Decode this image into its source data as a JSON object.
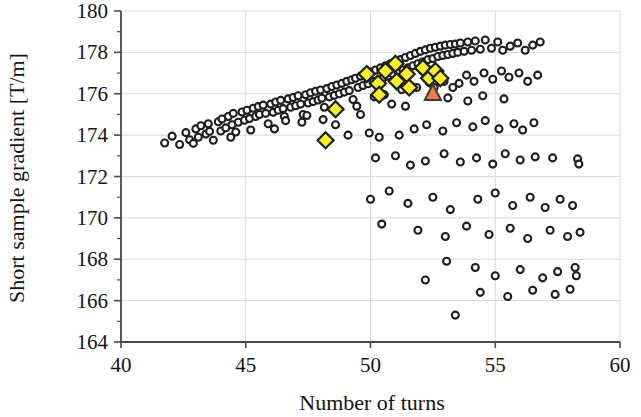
{
  "chart_data": {
    "type": "scatter",
    "title": "",
    "xlabel": "Number of turns",
    "ylabel": "Short sample gradient [T/m]",
    "xlim": [
      40,
      60
    ],
    "ylim": [
      164,
      180
    ],
    "xticks": [
      40,
      45,
      50,
      55,
      60
    ],
    "yticks": [
      164,
      166,
      168,
      170,
      172,
      174,
      176,
      178,
      180
    ],
    "grid": true,
    "grid_color": "#d8d8d8",
    "axis_color": "#4a4a4a",
    "legend": null,
    "series": [
      {
        "name": "design-population",
        "marker": "circle",
        "fill": "#ffffff",
        "edge": "#1e1e1e",
        "size": 7,
        "points": [
          [
            41.75,
            173.62
          ],
          [
            42.05,
            173.95
          ],
          [
            42.35,
            173.55
          ],
          [
            42.6,
            174.12
          ],
          [
            42.75,
            173.78
          ],
          [
            43.0,
            174.3
          ],
          [
            43.1,
            173.9
          ],
          [
            43.2,
            174.45
          ],
          [
            43.4,
            174.05
          ],
          [
            43.5,
            174.55
          ],
          [
            43.55,
            174.18
          ],
          [
            43.7,
            173.75
          ],
          [
            43.9,
            174.65
          ],
          [
            44.0,
            174.2
          ],
          [
            44.05,
            174.78
          ],
          [
            44.2,
            174.35
          ],
          [
            44.3,
            174.9
          ],
          [
            44.45,
            174.5
          ],
          [
            44.5,
            175.05
          ],
          [
            44.6,
            174.15
          ],
          [
            44.7,
            174.62
          ],
          [
            44.85,
            175.12
          ],
          [
            44.95,
            174.72
          ],
          [
            45.05,
            175.2
          ],
          [
            45.15,
            174.8
          ],
          [
            45.3,
            175.3
          ],
          [
            45.4,
            174.9
          ],
          [
            45.5,
            175.38
          ],
          [
            45.55,
            175.0
          ],
          [
            45.7,
            175.45
          ],
          [
            45.8,
            175.05
          ],
          [
            45.9,
            174.55
          ],
          [
            46.0,
            175.5
          ],
          [
            46.1,
            175.1
          ],
          [
            46.2,
            175.6
          ],
          [
            46.3,
            175.2
          ],
          [
            46.4,
            175.68
          ],
          [
            46.5,
            175.28
          ],
          [
            46.55,
            174.9
          ],
          [
            46.7,
            175.75
          ],
          [
            46.8,
            175.35
          ],
          [
            46.9,
            175.82
          ],
          [
            47.0,
            175.42
          ],
          [
            47.1,
            175.9
          ],
          [
            47.2,
            175.5
          ],
          [
            47.3,
            175.0
          ],
          [
            47.4,
            175.95
          ],
          [
            47.5,
            175.55
          ],
          [
            47.6,
            176.05
          ],
          [
            47.7,
            175.62
          ],
          [
            47.8,
            176.12
          ],
          [
            47.9,
            175.7
          ],
          [
            48.0,
            176.18
          ],
          [
            48.05,
            175.78
          ],
          [
            48.15,
            175.35
          ],
          [
            48.25,
            176.25
          ],
          [
            48.35,
            175.85
          ],
          [
            48.45,
            176.35
          ],
          [
            48.55,
            175.92
          ],
          [
            48.65,
            176.42
          ],
          [
            48.75,
            176.0
          ],
          [
            48.85,
            176.5
          ],
          [
            48.95,
            176.08
          ],
          [
            49.05,
            176.6
          ],
          [
            49.15,
            176.15
          ],
          [
            49.25,
            176.68
          ],
          [
            49.3,
            175.72
          ],
          [
            49.4,
            176.75
          ],
          [
            49.5,
            176.3
          ],
          [
            49.6,
            176.85
          ],
          [
            49.7,
            176.4
          ],
          [
            49.8,
            176.95
          ],
          [
            49.9,
            176.48
          ],
          [
            50.0,
            177.05
          ],
          [
            50.1,
            176.58
          ],
          [
            50.2,
            177.15
          ],
          [
            50.3,
            176.65
          ],
          [
            50.4,
            177.25
          ],
          [
            50.5,
            176.75
          ],
          [
            50.6,
            177.35
          ],
          [
            50.7,
            176.85
          ],
          [
            50.8,
            177.45
          ],
          [
            50.9,
            176.95
          ],
          [
            51.0,
            177.55
          ],
          [
            51.1,
            177.05
          ],
          [
            51.2,
            177.65
          ],
          [
            51.3,
            177.15
          ],
          [
            51.4,
            177.75
          ],
          [
            51.5,
            177.25
          ],
          [
            51.6,
            177.85
          ],
          [
            51.7,
            177.35
          ],
          [
            51.8,
            177.95
          ],
          [
            51.9,
            177.45
          ],
          [
            52.0,
            178.05
          ],
          [
            52.1,
            177.55
          ],
          [
            52.2,
            178.12
          ],
          [
            52.3,
            177.65
          ],
          [
            52.4,
            178.2
          ],
          [
            52.5,
            177.7
          ],
          [
            52.6,
            178.25
          ],
          [
            52.7,
            177.8
          ],
          [
            52.8,
            178.3
          ],
          [
            52.9,
            177.85
          ],
          [
            53.0,
            178.35
          ],
          [
            53.1,
            177.9
          ],
          [
            53.2,
            178.38
          ],
          [
            53.3,
            177.95
          ],
          [
            53.4,
            178.4
          ],
          [
            53.5,
            178.0
          ],
          [
            53.6,
            178.45
          ],
          [
            53.75,
            178.05
          ],
          [
            53.9,
            178.5
          ],
          [
            54.05,
            178.1
          ],
          [
            54.2,
            178.55
          ],
          [
            54.4,
            178.15
          ],
          [
            54.6,
            178.6
          ],
          [
            54.85,
            178.2
          ],
          [
            55.1,
            178.5
          ],
          [
            55.3,
            178.1
          ],
          [
            55.6,
            178.3
          ],
          [
            55.9,
            178.45
          ],
          [
            56.2,
            178.1
          ],
          [
            56.5,
            178.35
          ],
          [
            56.8,
            178.5
          ],
          [
            46.6,
            174.7
          ],
          [
            47.25,
            174.62
          ],
          [
            48.1,
            174.75
          ],
          [
            48.6,
            174.5
          ],
          [
            49.45,
            175.4
          ],
          [
            50.15,
            175.85
          ],
          [
            50.55,
            175.95
          ],
          [
            51.25,
            176.2
          ],
          [
            51.85,
            176.3
          ],
          [
            52.35,
            176.55
          ],
          [
            52.55,
            176.3
          ],
          [
            52.95,
            176.6
          ],
          [
            53.3,
            176.3
          ],
          [
            53.55,
            176.5
          ],
          [
            53.85,
            176.9
          ],
          [
            54.15,
            176.6
          ],
          [
            54.55,
            177.0
          ],
          [
            54.9,
            176.7
          ],
          [
            55.25,
            177.1
          ],
          [
            55.55,
            176.8
          ],
          [
            55.95,
            177.0
          ],
          [
            56.3,
            176.6
          ],
          [
            56.7,
            176.9
          ],
          [
            49.1,
            174.0
          ],
          [
            49.95,
            174.1
          ],
          [
            50.35,
            173.9
          ],
          [
            51.15,
            174.0
          ],
          [
            51.75,
            174.3
          ],
          [
            52.25,
            174.5
          ],
          [
            52.9,
            174.2
          ],
          [
            53.45,
            174.6
          ],
          [
            54.1,
            174.4
          ],
          [
            54.6,
            174.7
          ],
          [
            55.15,
            174.3
          ],
          [
            55.75,
            174.55
          ],
          [
            56.1,
            174.25
          ],
          [
            56.55,
            174.6
          ],
          [
            50.2,
            172.9
          ],
          [
            51.0,
            173.0
          ],
          [
            51.6,
            172.55
          ],
          [
            52.2,
            172.75
          ],
          [
            52.95,
            173.1
          ],
          [
            53.6,
            172.7
          ],
          [
            54.25,
            172.9
          ],
          [
            54.9,
            172.6
          ],
          [
            55.4,
            173.1
          ],
          [
            56.0,
            172.8
          ],
          [
            56.6,
            172.95
          ],
          [
            57.3,
            172.9
          ],
          [
            58.3,
            172.85
          ],
          [
            58.35,
            172.6
          ],
          [
            50.0,
            170.9
          ],
          [
            50.75,
            171.3
          ],
          [
            51.5,
            170.7
          ],
          [
            52.5,
            171.0
          ],
          [
            53.2,
            170.4
          ],
          [
            54.3,
            170.9
          ],
          [
            55.0,
            171.2
          ],
          [
            55.7,
            170.6
          ],
          [
            56.4,
            171.0
          ],
          [
            57.0,
            170.5
          ],
          [
            57.6,
            170.9
          ],
          [
            58.1,
            170.6
          ],
          [
            50.45,
            169.7
          ],
          [
            51.9,
            169.4
          ],
          [
            53.0,
            169.1
          ],
          [
            53.85,
            169.6
          ],
          [
            54.75,
            169.2
          ],
          [
            55.6,
            169.5
          ],
          [
            56.3,
            169.0
          ],
          [
            57.2,
            169.4
          ],
          [
            57.9,
            169.1
          ],
          [
            58.4,
            169.3
          ],
          [
            52.2,
            167.0
          ],
          [
            53.05,
            167.9
          ],
          [
            54.2,
            167.6
          ],
          [
            55.0,
            167.2
          ],
          [
            56.0,
            167.5
          ],
          [
            56.9,
            167.1
          ],
          [
            57.5,
            167.4
          ],
          [
            58.2,
            167.6
          ],
          [
            58.25,
            167.2
          ],
          [
            53.4,
            165.3
          ],
          [
            54.4,
            166.4
          ],
          [
            55.5,
            166.2
          ],
          [
            56.5,
            166.5
          ],
          [
            57.4,
            166.3
          ],
          [
            58.0,
            166.55
          ],
          [
            42.9,
            173.6
          ],
          [
            44.4,
            173.9
          ],
          [
            45.2,
            174.25
          ],
          [
            46.15,
            174.3
          ],
          [
            47.45,
            174.95
          ],
          [
            49.6,
            175.0
          ],
          [
            50.85,
            175.5
          ],
          [
            51.4,
            175.4
          ],
          [
            53.1,
            175.8
          ],
          [
            53.9,
            175.65
          ],
          [
            54.5,
            175.9
          ],
          [
            55.35,
            175.75
          ]
        ]
      },
      {
        "name": "selected-designs",
        "marker": "diamond",
        "fill": "#f7f028",
        "edge": "#1e1e1e",
        "size": 16,
        "points": [
          [
            48.6,
            175.25
          ],
          [
            48.2,
            173.75
          ],
          [
            49.85,
            176.95
          ],
          [
            50.3,
            176.5
          ],
          [
            50.6,
            177.1
          ],
          [
            50.35,
            175.95
          ],
          [
            51.05,
            176.6
          ],
          [
            51.0,
            177.45
          ],
          [
            51.45,
            176.95
          ],
          [
            51.55,
            176.3
          ],
          [
            52.1,
            177.25
          ],
          [
            52.35,
            176.75
          ],
          [
            52.6,
            177.1
          ],
          [
            52.8,
            176.75
          ]
        ]
      },
      {
        "name": "baseline-design",
        "marker": "triangle",
        "fill": "#f07a4a",
        "edge": "#3a3a3a",
        "size": 17,
        "points": [
          [
            52.5,
            176.05
          ]
        ]
      }
    ]
  },
  "axes": {
    "x_tick_labels": [
      "40",
      "45",
      "50",
      "55",
      "60"
    ],
    "y_tick_labels": [
      "164",
      "166",
      "168",
      "170",
      "172",
      "174",
      "176",
      "178",
      "180"
    ],
    "x_axis_title": "Number of turns",
    "y_axis_title": "Short sample gradient [T/m]"
  }
}
